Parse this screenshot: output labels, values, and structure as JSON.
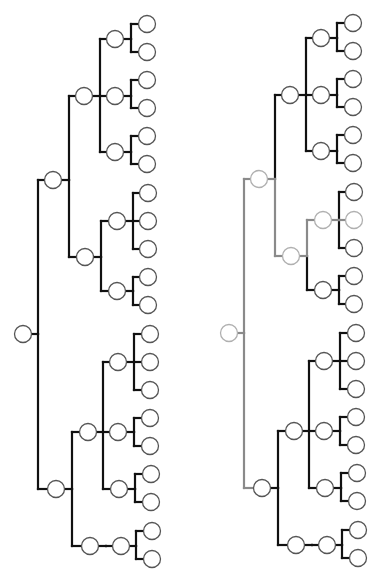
{
  "diagram": {
    "type": "tree-comparison",
    "colors": {
      "edge": "#111111",
      "node_stroke": "#555555",
      "node_fill": "#ffffff",
      "highlight_edge": "#8a8a8a",
      "highlight_node_stroke": "#b0b0b0",
      "background": "#ffffff"
    },
    "node_radius": 8.5,
    "edge_width": 2.2,
    "tree": {
      "id": "R",
      "x": 23,
      "y": 334,
      "trunk_x": 38,
      "children": [
        {
          "id": "A",
          "x": 53,
          "y": 180,
          "trunk_x": 69,
          "children": [
            {
              "id": "A1",
              "x": 84,
              "y": 96,
              "trunk_x": 100,
              "children": [
                {
                  "id": "A1a",
                  "x": 115,
                  "y": 39,
                  "trunk_x": 131,
                  "children": [
                    {
                      "id": "A1a1",
                      "x": 147,
                      "y": 24
                    },
                    {
                      "id": "A1a2",
                      "x": 147,
                      "y": 52
                    }
                  ]
                },
                {
                  "id": "A1b",
                  "x": 115,
                  "y": 96,
                  "trunk_x": 131,
                  "children": [
                    {
                      "id": "A1b1",
                      "x": 147,
                      "y": 80
                    },
                    {
                      "id": "A1b2",
                      "x": 147,
                      "y": 108
                    }
                  ]
                },
                {
                  "id": "A1c",
                  "x": 115,
                  "y": 152,
                  "trunk_x": 131,
                  "children": [
                    {
                      "id": "A1c1",
                      "x": 147,
                      "y": 136
                    },
                    {
                      "id": "A1c2",
                      "x": 147,
                      "y": 164
                    }
                  ]
                }
              ]
            },
            {
              "id": "A2",
              "x": 85,
              "y": 257,
              "trunk_x": 101,
              "children": [
                {
                  "id": "A2a",
                  "x": 117,
                  "y": 221,
                  "trunk_x": 133,
                  "children": [
                    {
                      "id": "A2a1",
                      "x": 148,
                      "y": 193
                    },
                    {
                      "id": "A2a2",
                      "x": 148,
                      "y": 221
                    },
                    {
                      "id": "A2a3",
                      "x": 148,
                      "y": 249
                    }
                  ]
                },
                {
                  "id": "A2b",
                  "x": 117,
                  "y": 291,
                  "trunk_x": 133,
                  "children": [
                    {
                      "id": "A2b1",
                      "x": 148,
                      "y": 277
                    },
                    {
                      "id": "A2b2",
                      "x": 148,
                      "y": 305
                    }
                  ]
                }
              ]
            }
          ]
        },
        {
          "id": "B",
          "x": 56,
          "y": 489,
          "trunk_x": 72,
          "children": [
            {
              "id": "B1",
              "x": 88,
              "y": 432,
              "trunk_x": 103,
              "children": [
                {
                  "id": "B1a",
                  "x": 118,
                  "y": 362,
                  "trunk_x": 134,
                  "children": [
                    {
                      "id": "B1a1",
                      "x": 150,
                      "y": 334
                    },
                    {
                      "id": "B1a2",
                      "x": 150,
                      "y": 362
                    },
                    {
                      "id": "B1a3",
                      "x": 150,
                      "y": 390
                    }
                  ]
                },
                {
                  "id": "B1b",
                  "x": 118,
                  "y": 432,
                  "trunk_x": 134,
                  "children": [
                    {
                      "id": "B1b1",
                      "x": 150,
                      "y": 418
                    },
                    {
                      "id": "B1b2",
                      "x": 150,
                      "y": 446
                    }
                  ]
                },
                {
                  "id": "B1c",
                  "x": 119,
                  "y": 489,
                  "trunk_x": 135,
                  "children": [
                    {
                      "id": "B1c1",
                      "x": 151,
                      "y": 474
                    },
                    {
                      "id": "B1c2",
                      "x": 151,
                      "y": 502
                    }
                  ]
                }
              ]
            },
            {
              "id": "B2",
              "x": 90,
              "y": 546,
              "trunk_x": 106,
              "children": [
                {
                  "id": "B2a",
                  "x": 121,
                  "y": 546,
                  "trunk_x": 136,
                  "children": [
                    {
                      "id": "B2a1",
                      "x": 152,
                      "y": 531
                    },
                    {
                      "id": "B2a2",
                      "x": 152,
                      "y": 559
                    }
                  ]
                }
              ]
            }
          ]
        }
      ]
    },
    "panels": [
      {
        "name": "left-tree",
        "offset_x": 0,
        "offset_y": 0,
        "highlight_nodes": [],
        "highlight_edges": []
      },
      {
        "name": "right-tree",
        "offset_x": 206,
        "offset_y": -1,
        "highlight_nodes": [
          "R",
          "A",
          "A2",
          "A2a",
          "A2a2"
        ],
        "highlight_edges": [
          "R-A",
          "R-B",
          "A-A2",
          "A2-A2a",
          "A2a-A2a2"
        ]
      }
    ]
  }
}
